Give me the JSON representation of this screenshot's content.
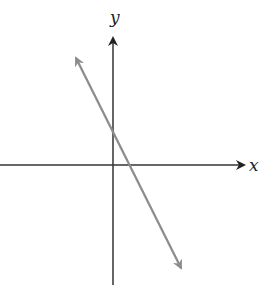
{
  "diagram": {
    "type": "coordinate-plane-line",
    "x_axis_label": "x",
    "y_axis_label": "y",
    "line": {
      "description": "line with negative slope, positive y-intercept",
      "color": "#8c8c8c",
      "start": [
        76,
        58
      ],
      "end": [
        181,
        268
      ]
    },
    "colors": {
      "axes": "#333333",
      "line": "#8c8c8c",
      "background": "#ffffff"
    }
  }
}
